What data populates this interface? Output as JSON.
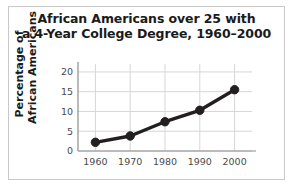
{
  "figure": {
    "frame_color": "#c9c9c9",
    "background": "#ffffff"
  },
  "chart_data": {
    "type": "line",
    "title": "African Americans over 25 with a 4-Year College Degree, 1960–2000",
    "title_line1": "African Americans over 25 with",
    "title_line2": "a 4-Year College Degree, 1960–2000",
    "xlabel": "",
    "ylabel": "Percentage of African Americans",
    "ylabel_line1": "Percentage of",
    "ylabel_line2": "African Americans",
    "categories": [
      "1960",
      "1970",
      "1980",
      "1990",
      "2000"
    ],
    "x": [
      1960,
      1970,
      1980,
      1990,
      2000
    ],
    "values": [
      2.2,
      3.8,
      7.4,
      10.3,
      15.5
    ],
    "series": [
      {
        "name": "Percentage of African Americans over 25 with a 4-year college degree",
        "values": [
          2.2,
          3.8,
          7.4,
          10.3,
          15.5
        ],
        "color": "#231f20",
        "marker": "circle"
      }
    ],
    "xlim": [
      1955,
      2005
    ],
    "ylim": [
      0,
      22
    ],
    "yticks": [
      0,
      5,
      10,
      15,
      20
    ],
    "ytick_labels": [
      "0",
      "5",
      "10",
      "15",
      "20"
    ],
    "xticks": [
      1960,
      1970,
      1980,
      1990,
      2000
    ],
    "xtick_labels": [
      "1960",
      "1970",
      "1980",
      "1990",
      "2000"
    ],
    "grid": true,
    "grid_color": "#d6d6d6",
    "axis_color": "#8c8c8c",
    "legend": false,
    "legend_position": "none",
    "line_color": "#231f20",
    "line_width": 3.4,
    "marker_size": 4.2
  }
}
